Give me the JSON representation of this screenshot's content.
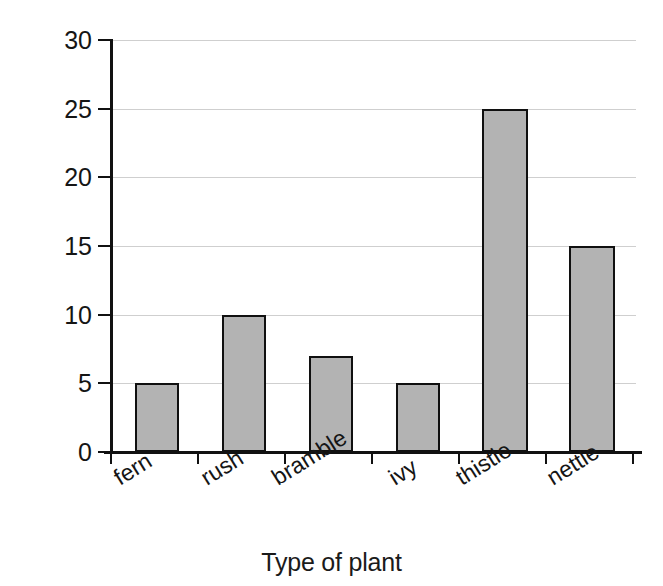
{
  "chart_data": {
    "type": "bar",
    "title": "",
    "xlabel": "Type of plant",
    "ylabel": "Number",
    "categories": [
      "fern",
      "rush",
      "bramble",
      "ivy",
      "thistle",
      "nettle"
    ],
    "values": [
      5,
      10,
      7,
      5,
      25,
      15
    ],
    "ylim": [
      0,
      30
    ],
    "ytick_labels": [
      "0",
      "5",
      "10",
      "15",
      "20",
      "25",
      "30"
    ],
    "ytick_values": [
      0,
      5,
      10,
      15,
      20,
      25,
      30
    ],
    "grid": "horizontal",
    "legend": "none",
    "bar_fill_color": "#b3b3b3",
    "bar_edge_color": "#101010",
    "gridline_color": "#cfcfcf",
    "axis_color": "#111111",
    "background_color": "#ffffff",
    "xtick_label_rotation": -32
  },
  "axes": {
    "y_title": "Number",
    "x_title": "Type of plant"
  }
}
